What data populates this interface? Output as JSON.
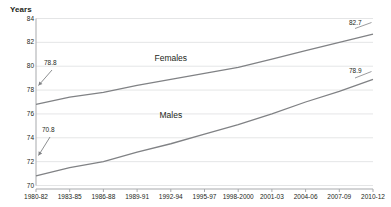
{
  "chart_data": {
    "type": "line",
    "title": "",
    "subtitle": "",
    "ylabel": "Years",
    "xlabel": "",
    "ylim": [
      70,
      84
    ],
    "yticks": [
      70,
      72,
      74,
      76,
      78,
      80,
      82,
      84
    ],
    "ytick_labels": [
      "70",
      "72",
      "74",
      "76",
      "78",
      "80",
      "82",
      "84"
    ],
    "grid": true,
    "grid_orientation": "horizontal",
    "legend_position": "inline-annotation",
    "categories": [
      "1980-82",
      "1983-85",
      "1986-88",
      "1989-91",
      "1992-94",
      "1995-97",
      "1998-2000",
      "2001-03",
      "2004-06",
      "2007-09",
      "2010-12"
    ],
    "series": [
      {
        "name": "Females",
        "color": "#808285",
        "values": [
          76.8,
          77.4,
          77.8,
          78.4,
          78.9,
          79.4,
          79.9,
          80.6,
          81.3,
          82.0,
          82.7
        ]
      },
      {
        "name": "Males",
        "color": "#808285",
        "values": [
          70.8,
          71.5,
          72.0,
          72.8,
          73.5,
          74.3,
          75.1,
          76.0,
          77.0,
          77.9,
          78.9
        ]
      }
    ],
    "annotations": [
      {
        "text": "78.8",
        "series": "Females",
        "position": "start",
        "value": 78.8
      },
      {
        "text": "82.7",
        "series": "Females",
        "position": "end",
        "value": 82.7
      },
      {
        "text": "70.8",
        "series": "Males",
        "position": "start",
        "value": 70.8
      },
      {
        "text": "78.9",
        "series": "Males",
        "position": "end",
        "value": 78.9
      }
    ],
    "series_inline_labels": [
      {
        "text": "Females",
        "x_category": "1992-94",
        "y": 80.6
      },
      {
        "text": "Males",
        "x_category": "1992-94",
        "y": 75.8
      }
    ],
    "colors": {
      "line": "#808285",
      "grid": "#d9dadb",
      "axis": "#a7a9ac",
      "text": "#231f20"
    }
  }
}
